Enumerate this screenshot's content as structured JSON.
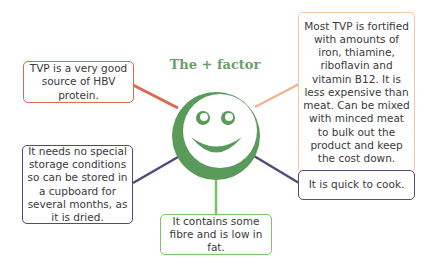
{
  "title": "The + factor",
  "colors": {
    "accent_green": "#5a9a5a",
    "title_green": "#6a9e6a",
    "red": "#d9694f",
    "orange": "#f2b38a",
    "navy": "#4a4c80",
    "purple": "#5a4a78",
    "light_green": "#7cc26a"
  },
  "center_icon": "smiley-face",
  "boxes": [
    {
      "id": "protein",
      "text": "TVP is a very good source of HBV protein."
    },
    {
      "id": "fortified",
      "text": "Most TVP is fortified with amounts of iron, thiamine, riboflavin and vitamin B12. It is less expensive than meat. Can be mixed with minced meat to bulk out the product and keep the cost down."
    },
    {
      "id": "storage",
      "text": "It needs no special storage conditions so can be stored in a cupboard for several months, as it is dried."
    },
    {
      "id": "quick",
      "text": "It is quick to cook."
    },
    {
      "id": "fibre",
      "text": "It contains some fibre and is low in fat."
    }
  ]
}
